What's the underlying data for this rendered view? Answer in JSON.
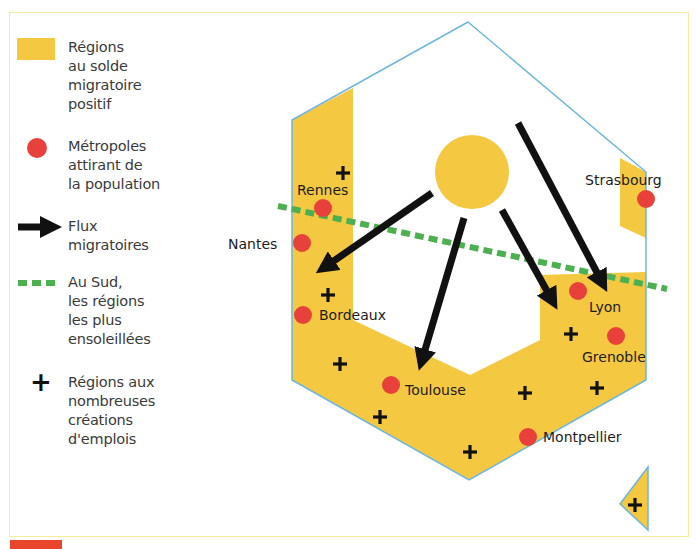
{
  "colors": {
    "region_fill": "#f5c842",
    "metropole": "#e8403a",
    "flux": "#111111",
    "sun_line": "#4caf50",
    "outline": "#6cb6e0",
    "frame": "#f4ec9a"
  },
  "legend": {
    "items": [
      {
        "symbol": "yellow-rectangle",
        "label": "Régions\nau solde\nmigratoire\npositif"
      },
      {
        "symbol": "red-dot",
        "label": "Métropoles\nattirant de\nla population"
      },
      {
        "symbol": "black-arrow",
        "label": "Flux\nmigratoires"
      },
      {
        "symbol": "green-dashed-line",
        "label": "Au Sud,\nles régions\nles plus\nensoleillées"
      },
      {
        "symbol": "plus-sign",
        "label": "Régions aux\nnombreuses\ncréations\nd'emplois"
      }
    ]
  },
  "map": {
    "cities": [
      {
        "name": "Rennes",
        "x": 323,
        "y": 208
      },
      {
        "name": "Nantes",
        "x": 302,
        "y": 243
      },
      {
        "name": "Bordeaux",
        "x": 303,
        "y": 315
      },
      {
        "name": "Toulouse",
        "x": 391,
        "y": 385
      },
      {
        "name": "Montpellier",
        "x": 528,
        "y": 437
      },
      {
        "name": "Lyon",
        "x": 578,
        "y": 291
      },
      {
        "name": "Grenoble",
        "x": 616,
        "y": 336
      },
      {
        "name": "Strasbourg",
        "x": 646,
        "y": 199
      }
    ],
    "labels": {
      "rennes": "Rennes",
      "nantes": "Nantes",
      "bordeaux": "Bordeaux",
      "toulouse": "Toulouse",
      "montpellier": "Montpellier",
      "lyon": "Lyon",
      "grenoble": "Grenoble",
      "strasbourg": "Strasbourg"
    },
    "plus_signs": [
      [
        343,
        173
      ],
      [
        328,
        295
      ],
      [
        340,
        364
      ],
      [
        380,
        417
      ],
      [
        470,
        452
      ],
      [
        525,
        392
      ],
      [
        571,
        334
      ],
      [
        597,
        388
      ],
      [
        635,
        505
      ]
    ],
    "flux": [
      {
        "from": [
          430,
          193
        ],
        "to": [
          318,
          272
        ]
      },
      {
        "from": [
          463,
          218
        ],
        "to": [
          419,
          368
        ]
      },
      {
        "from": [
          502,
          210
        ],
        "to": [
          556,
          306
        ]
      },
      {
        "from": [
          517,
          123
        ],
        "to": [
          606,
          288
        ]
      }
    ]
  }
}
